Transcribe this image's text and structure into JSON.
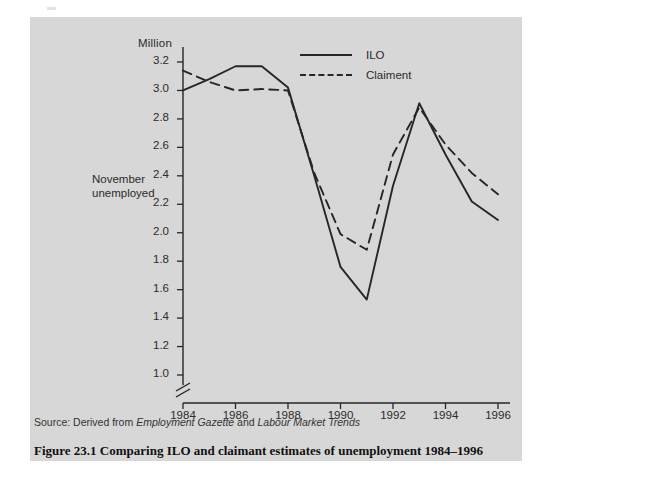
{
  "figure": {
    "caption": "Figure 23.1  Comparing ILO and claimant estimates of unemployment 1984–1996",
    "source_prefix": "Source: Derived from ",
    "source_italic_1": "Employment Gazette",
    "source_conjunction": " and ",
    "source_italic_2": "Labour Market Trends",
    "panel_color": "#d7d7d7",
    "page_color": "#ffffff",
    "ink_color": "#262626"
  },
  "chart_data": {
    "type": "line",
    "title": "",
    "subtitle": "",
    "unit_label": "Million",
    "ylabel": "November unemployed",
    "xlabel": "",
    "x": [
      1984,
      1985,
      1986,
      1987,
      1988,
      1989,
      1990,
      1991,
      1992,
      1993,
      1994,
      1995,
      1996
    ],
    "xtick_labels": [
      "1984",
      "1986",
      "1988",
      "1990",
      "1992",
      "1994",
      "1996"
    ],
    "xticks": [
      1984,
      1986,
      1988,
      1990,
      1992,
      1994,
      1996
    ],
    "ytick_labels": [
      "1.0",
      "1.2",
      "1.4",
      "1.6",
      "1.8",
      "2.0",
      "2.2",
      "2.4",
      "2.6",
      "2.8",
      "3.0",
      "3.2"
    ],
    "yticks": [
      1.0,
      1.2,
      1.4,
      1.6,
      1.8,
      2.0,
      2.2,
      2.4,
      2.6,
      2.8,
      3.0,
      3.2
    ],
    "ylim": [
      1.0,
      3.3
    ],
    "xlim": [
      1984,
      1996
    ],
    "axis_break": true,
    "grid": false,
    "legend_position": "top-center",
    "series": [
      {
        "name": "ILO",
        "style": "solid",
        "color": "#262626",
        "values": [
          3.0,
          3.08,
          3.17,
          3.17,
          3.02,
          2.4,
          1.76,
          1.53,
          2.33,
          2.91,
          2.55,
          2.22,
          2.09
        ]
      },
      {
        "name": "Claiment",
        "style": "dashed",
        "color": "#262626",
        "values": [
          3.14,
          3.06,
          3.0,
          3.01,
          3.0,
          2.42,
          1.99,
          1.88,
          2.55,
          2.88,
          2.62,
          2.42,
          2.27
        ]
      }
    ]
  }
}
